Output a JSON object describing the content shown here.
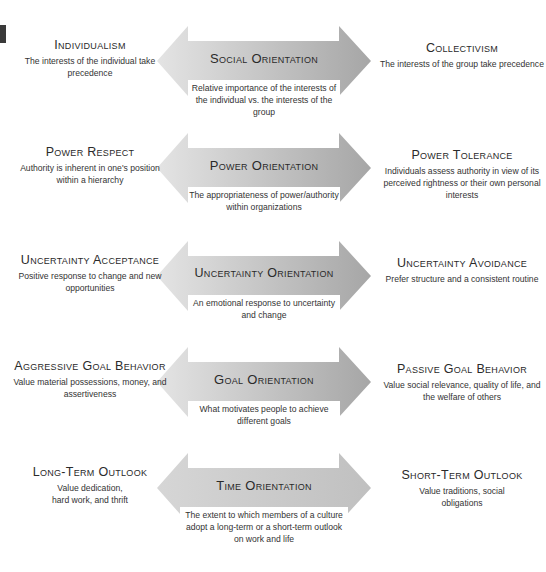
{
  "colors": {
    "arrow_light": "#e2e2e2",
    "arrow_dark": "#a6a6a6",
    "text": "#333333",
    "marker": "#3a3a3a"
  },
  "rows": [
    {
      "center_title": "Social Orientation",
      "center_desc": "Relative importance of the interests of the individual vs. the interests of the group",
      "left_title": "Individualism",
      "left_desc": "The interests of the individual take precedence",
      "right_title": "Collectivism",
      "right_desc": "The interests of the group take precedence"
    },
    {
      "center_title": "Power Orientation",
      "center_desc": "The appropriateness of power/authority within organizations",
      "left_title": "Power Respect",
      "left_desc": "Authority is inherent in one's position within a hierarchy",
      "right_title": "Power Tolerance",
      "right_desc": "Individuals assess authority in view of its perceived rightness or their own personal interests"
    },
    {
      "center_title": "Uncertainty Orientation",
      "center_desc": "An emotional response to uncertainty and change",
      "left_title": "Uncertainty Acceptance",
      "left_desc": "Positive response to change and new opportunities",
      "right_title": "Uncertainty Avoidance",
      "right_desc": "Prefer structure and a consistent routine"
    },
    {
      "center_title": "Goal Orientation",
      "center_desc": "What motivates people to achieve different goals",
      "left_title": "Aggressive Goal Behavior",
      "left_desc": "Value material possessions, money, and assertiveness",
      "right_title": "Passive Goal Behavior",
      "right_desc": "Value social relevance, quality of life, and the welfare of others"
    },
    {
      "center_title": "Time Orientation",
      "center_desc": "The extent to which members of a culture adopt a long-term or a short-term outlook on work and life",
      "left_title": "Long-Term Outlook",
      "left_desc": "Value dedication, hard work, and thrift",
      "right_title": "Short-Term Outlook",
      "right_desc": "Value traditions, social obligations"
    }
  ]
}
